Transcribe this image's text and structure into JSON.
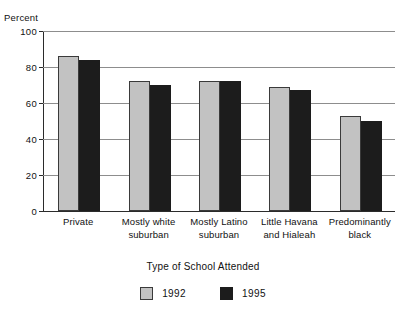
{
  "chart_data": {
    "type": "bar",
    "title": "",
    "xlabel": "Type of School Attended",
    "ylabel": "Percent",
    "ylim": [
      0,
      100
    ],
    "yticks": [
      0,
      20,
      40,
      60,
      80,
      100
    ],
    "grid": true,
    "legend_position": "bottom",
    "categories": [
      "Private",
      "Mostly white suburban",
      "Mostly Latino suburban",
      "Little Havana and Hialeah",
      "Predominantly black"
    ],
    "category_lines": [
      [
        "Private"
      ],
      [
        "Mostly white",
        "suburban"
      ],
      [
        "Mostly Latino",
        "suburban"
      ],
      [
        "Little Havana",
        "and Hialeah"
      ],
      [
        "Predominantly",
        "black"
      ]
    ],
    "series": [
      {
        "name": "1992",
        "color": "#c2c2c2",
        "values": [
          86,
          72,
          72,
          69,
          53
        ]
      },
      {
        "name": "1995",
        "color": "#1c1c1c",
        "values": [
          84,
          70,
          72,
          67,
          50
        ]
      }
    ]
  }
}
